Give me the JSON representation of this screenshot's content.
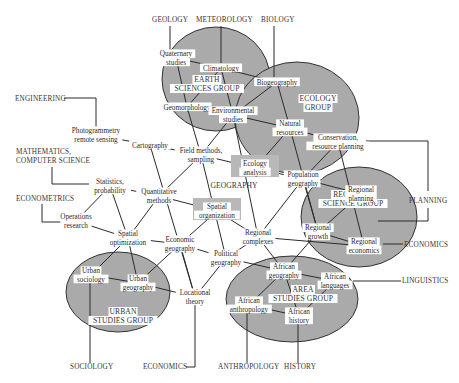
{
  "groups": [
    {
      "id": "earth",
      "label_lines": [
        "EARTH",
        "SCIENCES GROUP"
      ],
      "cx": 216,
      "cy": 79,
      "rx": 54,
      "ry": 52,
      "lx": 207,
      "ly": 82
    },
    {
      "id": "ecology",
      "label_lines": [
        "ECOLOGY",
        "GROUP"
      ],
      "cx": 297,
      "cy": 118,
      "rx": 62,
      "ry": 56,
      "lx": 318,
      "ly": 101
    },
    {
      "id": "regional",
      "label_lines": [
        "REGIONAL",
        "SCIENCE GROUP"
      ],
      "cx": 359,
      "cy": 217,
      "rx": 58,
      "ry": 50,
      "lx": 353,
      "ly": 197
    },
    {
      "id": "urban",
      "label_lines": [
        "URBAN",
        "STUDIES GROUP"
      ],
      "cx": 118,
      "cy": 292,
      "rx": 52,
      "ry": 40,
      "lx": 123,
      "ly": 314
    },
    {
      "id": "area",
      "label_lines": [
        "AREA",
        "STUDIES GROUP"
      ],
      "cx": 292,
      "cy": 299,
      "rx": 66,
      "ry": 43,
      "lx": 303,
      "ly": 292
    }
  ],
  "nodes": [
    {
      "id": "quaternary",
      "lines": [
        "Quaternary",
        "studies"
      ],
      "x": 176,
      "y": 58
    },
    {
      "id": "climatology",
      "lines": [
        "Climatology"
      ],
      "x": 221,
      "y": 68
    },
    {
      "id": "geomorphology",
      "lines": [
        "Geomorphology"
      ],
      "x": 187,
      "y": 107
    },
    {
      "id": "environmental",
      "lines": [
        "Environmental",
        "studies"
      ],
      "x": 233,
      "y": 115
    },
    {
      "id": "biogeography",
      "lines": [
        "Biogeography"
      ],
      "x": 277,
      "y": 82
    },
    {
      "id": "natural",
      "lines": [
        "Natural",
        "resources"
      ],
      "x": 290,
      "y": 128
    },
    {
      "id": "conservation",
      "lines": [
        "Conservation,",
        "resource planning"
      ],
      "x": 338,
      "y": 142
    },
    {
      "id": "photogrammetry",
      "lines": [
        "Photogrammetry",
        "remote sensing"
      ],
      "x": 96,
      "y": 135
    },
    {
      "id": "cartography",
      "lines": [
        "Cartography"
      ],
      "x": 150,
      "y": 145
    },
    {
      "id": "fieldmethods",
      "lines": [
        "Field methods,",
        "sampling"
      ],
      "x": 201,
      "y": 155
    },
    {
      "id": "ecologyanalysis",
      "lines": [
        "Ecology",
        "analysis"
      ],
      "x": 255,
      "y": 168
    },
    {
      "id": "population",
      "lines": [
        "Population",
        "geography"
      ],
      "x": 303,
      "y": 179
    },
    {
      "id": "statistics",
      "lines": [
        "Statistics,",
        "probability"
      ],
      "x": 110,
      "y": 186
    },
    {
      "id": "quantitative",
      "lines": [
        "Quantitative",
        "methods"
      ],
      "x": 159,
      "y": 196
    },
    {
      "id": "spatialorg",
      "lines": [
        "Spatial",
        "organization"
      ],
      "x": 217,
      "y": 211
    },
    {
      "id": "regionalcomplexes",
      "lines": [
        "Regional",
        "complexes"
      ],
      "x": 258,
      "y": 237
    },
    {
      "id": "regionalplanning",
      "lines": [
        "Regional",
        "planning"
      ],
      "x": 361,
      "y": 194
    },
    {
      "id": "regionalgrowth",
      "lines": [
        "Regional",
        "growth"
      ],
      "x": 318,
      "y": 232
    },
    {
      "id": "regionaleconomics",
      "lines": [
        "Regional",
        "economics"
      ],
      "x": 364,
      "y": 246
    },
    {
      "id": "operations",
      "lines": [
        "Operations",
        "research"
      ],
      "x": 76,
      "y": 221
    },
    {
      "id": "spatialopt",
      "lines": [
        "Spatial",
        "optimization"
      ],
      "x": 128,
      "y": 238
    },
    {
      "id": "economicgeo",
      "lines": [
        "Economic",
        "geography"
      ],
      "x": 180,
      "y": 244
    },
    {
      "id": "politicalgeo",
      "lines": [
        "Political",
        "geography"
      ],
      "x": 226,
      "y": 258
    },
    {
      "id": "urbansociology",
      "lines": [
        "Urban",
        "sociology"
      ],
      "x": 91,
      "y": 275
    },
    {
      "id": "urbangeography",
      "lines": [
        "Urban",
        "geography"
      ],
      "x": 138,
      "y": 283
    },
    {
      "id": "locational",
      "lines": [
        "Locational",
        "theory"
      ],
      "x": 195,
      "y": 297
    },
    {
      "id": "africangeo",
      "lines": [
        "African",
        "geography"
      ],
      "x": 284,
      "y": 271
    },
    {
      "id": "africanlang",
      "lines": [
        "African",
        "languages"
      ],
      "x": 335,
      "y": 281
    },
    {
      "id": "africananthro",
      "lines": [
        "African",
        "anthropology"
      ],
      "x": 249,
      "y": 305
    },
    {
      "id": "africanhistory",
      "lines": [
        "African",
        "history"
      ],
      "x": 299,
      "y": 316
    }
  ],
  "links": [
    [
      "quaternary",
      "climatology"
    ],
    [
      "quaternary",
      "geomorphology"
    ],
    [
      "climatology",
      "geomorphology"
    ],
    [
      "climatology",
      "environmental"
    ],
    [
      "climatology",
      "biogeography"
    ],
    [
      "geomorphology",
      "environmental"
    ],
    [
      "geomorphology",
      "fieldmethods"
    ],
    [
      "biogeography",
      "environmental"
    ],
    [
      "biogeography",
      "natural"
    ],
    [
      "environmental",
      "natural"
    ],
    [
      "environmental",
      "fieldmethods"
    ],
    [
      "environmental",
      "regionalcomplexes"
    ],
    [
      "natural",
      "ecologyanalysis"
    ],
    [
      "natural",
      "conservation"
    ],
    [
      "natural",
      "regionalgrowth"
    ],
    [
      "conservation",
      "population"
    ],
    [
      "conservation",
      "regionaleconomics"
    ],
    [
      "photogrammetry",
      "cartography"
    ],
    [
      "cartography",
      "fieldmethods"
    ],
    [
      "cartography",
      "locational"
    ],
    [
      "fieldmethods",
      "ecologyanalysis"
    ],
    [
      "fieldmethods",
      "quantitative"
    ],
    [
      "fieldmethods",
      "politicalgeo"
    ],
    [
      "ecologyanalysis",
      "population"
    ],
    [
      "population",
      "regionalplanning"
    ],
    [
      "population",
      "regionalcomplexes"
    ],
    [
      "population",
      "regionalgrowth"
    ],
    [
      "statistics",
      "quantitative"
    ],
    [
      "statistics",
      "operations"
    ],
    [
      "statistics",
      "spatialopt"
    ],
    [
      "quantitative",
      "spatialorg"
    ],
    [
      "quantitative",
      "spatialopt"
    ],
    [
      "spatialorg",
      "regionalcomplexes"
    ],
    [
      "spatialorg",
      "economicgeo"
    ],
    [
      "regionalcomplexes",
      "regionaleconomics"
    ],
    [
      "regionalcomplexes",
      "politicalgeo"
    ],
    [
      "regionalcomplexes",
      "africangeo"
    ],
    [
      "regionalgrowth",
      "africangeo"
    ],
    [
      "regionalplanning",
      "regionalgrowth"
    ],
    [
      "regionalgrowth",
      "regionaleconomics"
    ],
    [
      "operations",
      "spatialopt"
    ],
    [
      "spatialopt",
      "economicgeo"
    ],
    [
      "spatialopt",
      "urbansociology"
    ],
    [
      "spatialopt",
      "urbangeography"
    ],
    [
      "economicgeo",
      "politicalgeo"
    ],
    [
      "economicgeo",
      "urbangeography"
    ],
    [
      "economicgeo",
      "locational"
    ],
    [
      "politicalgeo",
      "africangeo"
    ],
    [
      "politicalgeo",
      "locational"
    ],
    [
      "urbansociology",
      "urbangeography"
    ],
    [
      "urbangeography",
      "locational"
    ],
    [
      "africangeo",
      "africanlang"
    ],
    [
      "africangeo",
      "africananthro"
    ],
    [
      "africangeo",
      "africanhistory"
    ],
    [
      "africananthro",
      "africanhistory"
    ],
    [
      "africanlang",
      "africanhistory"
    ]
  ],
  "center": {
    "label": "GEOGRAPHY",
    "x": 234,
    "y": 188
  },
  "disciplines": [
    {
      "label": "GEOLOGY",
      "x": 152,
      "y": 22,
      "anchor": "start",
      "path": "M170,26 L170,52"
    },
    {
      "label": "METEOROLOGY",
      "x": 196,
      "y": 22,
      "anchor": "start",
      "path": "M221,26 L221,63"
    },
    {
      "label": "BIOLOGY",
      "x": 261,
      "y": 22,
      "anchor": "start",
      "path": "M274,26 L274,77"
    },
    {
      "label": "ENGINEERING",
      "x": 15,
      "y": 101,
      "anchor": "start",
      "path": "M64,98 L96,98 L96,127"
    },
    {
      "label": "MATHEMATICS,",
      "x": 16,
      "y": 154,
      "anchor": "start",
      "path": null
    },
    {
      "label": "COMPUTER SCIENCE",
      "x": 16,
      "y": 163,
      "anchor": "start",
      "path": "M52,167 L52,184 L98,184"
    },
    {
      "label": "ECONOMETRICS",
      "x": 16,
      "y": 201,
      "anchor": "start",
      "path": "M42,204 L42,222 L64,222"
    },
    {
      "label": "PLANNING",
      "x": 409,
      "y": 203,
      "anchor": "start",
      "path": "M366,141 L428,141 L428,191 M428,208 L428,221 L378,221"
    },
    {
      "label": "ECONOMICS",
      "x": 404,
      "y": 247,
      "anchor": "start",
      "path": "M383,244 L403,244"
    },
    {
      "label": "LINGUISTICS",
      "x": 402,
      "y": 283,
      "anchor": "start",
      "path": "M353,281 L401,281"
    },
    {
      "label": "SOCIOLOGY",
      "x": 70,
      "y": 369,
      "anchor": "start",
      "path": "M90,281 L90,363"
    },
    {
      "label": "ECONOMICS",
      "x": 143,
      "y": 369,
      "anchor": "start",
      "path": "M195,305 L195,367 L186,367"
    },
    {
      "label": "ANTHROPOLOGY",
      "x": 218,
      "y": 369,
      "anchor": "start",
      "path": "M247,311 L247,363"
    },
    {
      "label": "HISTORY",
      "x": 284,
      "y": 369,
      "anchor": "start",
      "path": "M298,322 L298,363"
    }
  ]
}
